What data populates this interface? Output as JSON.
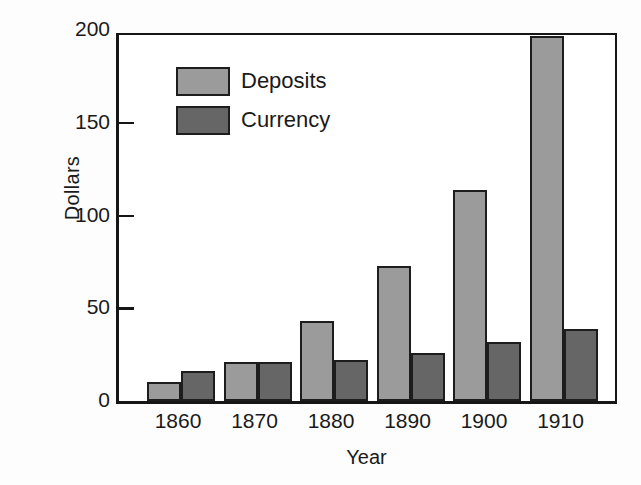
{
  "chart_data": {
    "type": "bar",
    "title": "",
    "xlabel": "Year",
    "ylabel": "Dollars",
    "categories": [
      "1860",
      "1870",
      "1880",
      "1890",
      "1900",
      "1910"
    ],
    "series": [
      {
        "name": "Deposits",
        "color": "#9b9b9b",
        "values": [
          10,
          21,
          43,
          73,
          114,
          197
        ]
      },
      {
        "name": "Currency",
        "color": "#666666",
        "values": [
          16,
          21,
          22,
          26,
          32,
          39
        ]
      }
    ],
    "ylim": [
      0,
      200
    ],
    "yticks": [
      0,
      50,
      100,
      150,
      200
    ],
    "ytick_labels": [
      "0",
      "50",
      "100",
      "150",
      "200"
    ],
    "grid": false,
    "legend_position": "upper-left-inside",
    "frame": "box",
    "bar_edge_color": "#1d1d1d"
  },
  "legend": {
    "entries": [
      {
        "label": "Deposits",
        "swatch": "#9b9b9b"
      },
      {
        "label": "Currency",
        "swatch": "#666666"
      }
    ]
  }
}
